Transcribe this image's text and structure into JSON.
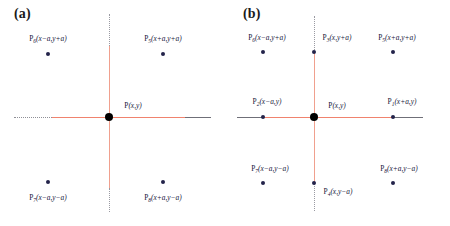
{
  "figure": {
    "background": "#ffffff",
    "accent_line_color": "#f0836e",
    "accent_line_color_soft": "#f0a08e",
    "dotted_line_color": "#9a9aa2",
    "point_color": "#23234a",
    "center_point_color": "#000000"
  },
  "panels": [
    {
      "id": "a",
      "letter": "(a)",
      "center": {
        "label_prefix": "P",
        "label_sub": "",
        "coords": "(x,y)"
      },
      "points": [
        {
          "name": "P6",
          "prefix": "P",
          "sub": "6",
          "coords": "(x−a,y+a)",
          "x": 48,
          "y": 54,
          "label_x": 48,
          "label_y": 38
        },
        {
          "name": "P5",
          "prefix": "P",
          "sub": "5",
          "coords": "(x+a,y+a)",
          "x": 163,
          "y": 54,
          "label_x": 163,
          "label_y": 38
        },
        {
          "name": "P7",
          "prefix": "P",
          "sub": "7",
          "coords": "(x−a,y−a)",
          "x": 48,
          "y": 182,
          "label_x": 48,
          "label_y": 197
        },
        {
          "name": "P8",
          "prefix": "P",
          "sub": "8",
          "coords": "(x+a,y−a)",
          "x": 163,
          "y": 182,
          "label_x": 163,
          "label_y": 197
        }
      ]
    },
    {
      "id": "b",
      "letter": "(b)",
      "center": {
        "label_prefix": "P",
        "label_sub": "",
        "coords": "(x,y)"
      },
      "points": [
        {
          "name": "P6",
          "prefix": "P",
          "sub": "6",
          "coords": "(x−a,y+a)",
          "x": 38,
          "y": 52,
          "label_x": 42,
          "label_y": 37
        },
        {
          "name": "P3",
          "prefix": "P",
          "sub": "3",
          "coords": "(x,y+a)",
          "x": 89,
          "y": 52,
          "label_x": 112,
          "label_y": 37
        },
        {
          "name": "P5",
          "prefix": "P",
          "sub": "5",
          "coords": "(x+a,y+a)",
          "x": 168,
          "y": 52,
          "label_x": 172,
          "label_y": 37
        },
        {
          "name": "P2",
          "prefix": "P",
          "sub": "2",
          "coords": "(x−a,y)",
          "x": 38,
          "y": 117,
          "label_x": 42,
          "label_y": 101
        },
        {
          "name": "P1",
          "prefix": "P",
          "sub": "1",
          "coords": "(x+a,y)",
          "x": 168,
          "y": 117,
          "label_x": 177,
          "label_y": 101
        },
        {
          "name": "P7",
          "prefix": "P",
          "sub": "7",
          "coords": "(x−a,y−a)",
          "x": 38,
          "y": 183,
          "label_x": 45,
          "label_y": 168
        },
        {
          "name": "P4",
          "prefix": "P",
          "sub": "4",
          "coords": "(x,y−a)",
          "x": 89,
          "y": 183,
          "label_x": 113,
          "label_y": 191
        },
        {
          "name": "P8",
          "prefix": "P",
          "sub": "8",
          "coords": "(x+a,y−a)",
          "x": 168,
          "y": 183,
          "label_x": 174,
          "label_y": 168
        }
      ]
    }
  ]
}
